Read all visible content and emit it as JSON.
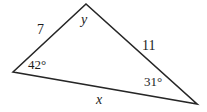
{
  "figure": {
    "type": "triangle-diagram",
    "background_color": "#ffffff",
    "stroke_color": "#262626",
    "text_color": "#1c1c1c",
    "width": 207,
    "height": 112
  },
  "triangle": {
    "vertices": {
      "left": {
        "x": 13,
        "y": 72
      },
      "top": {
        "x": 86,
        "y": 4
      },
      "right": {
        "x": 197,
        "y": 104
      }
    }
  },
  "labels": {
    "side_left": "7",
    "side_right": "11",
    "side_bottom": "x",
    "vertex_top": "y",
    "angle_left": "42°",
    "angle_right": "31°"
  }
}
